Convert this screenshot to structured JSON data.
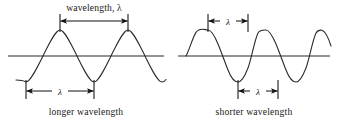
{
  "figure": {
    "title_visible": false,
    "background_color": "#ffffff",
    "stroke_color": "#2b2b2b",
    "label_color": "#1a1a1a",
    "width": 340,
    "height": 122
  },
  "panels": [
    {
      "id": "longer",
      "caption": "longer wavelength",
      "top_label": "wavelength, λ",
      "bottom_label": "λ",
      "wave": {
        "baseline_y": 56,
        "amplitude_px": 26,
        "wavelength_px": 68,
        "crest_xs": [
          60,
          128
        ],
        "trough_xs": [
          26,
          94,
          162
        ],
        "x_start": 16,
        "x_end": 166
      },
      "top_dimension": {
        "from_x": 60,
        "to_x": 128,
        "y": 21,
        "spans": "crest-to-crest"
      },
      "bottom_dimension": {
        "from_x": 26,
        "to_x": 94,
        "y": 91,
        "spans": "trough-to-trough"
      }
    },
    {
      "id": "shorter",
      "caption": "shorter wavelength",
      "top_label": "λ",
      "bottom_label": "λ",
      "wave": {
        "baseline_y": 56,
        "amplitude_px": 26,
        "wavelength_px": 40,
        "crest_xs": [
          212,
          252,
          292
        ],
        "trough_xs": [
          192,
          232,
          272,
          312
        ],
        "x_start": 186,
        "x_end": 318
      },
      "top_dimension": {
        "from_x": 212,
        "to_x": 252,
        "y": 21,
        "spans": "crest-to-crest"
      },
      "bottom_dimension": {
        "from_x": 232,
        "to_x": 272,
        "y": 91,
        "spans": "trough-to-trough"
      }
    }
  ],
  "captions": {
    "left": "longer wavelength",
    "right": "shorter wavelength"
  },
  "labels": {
    "left_top": "wavelength, λ",
    "left_bottom": "λ",
    "right_top": "λ",
    "right_bottom": "λ"
  },
  "caption_positions": {
    "left_x": 86,
    "right_x": 254,
    "y": 115
  }
}
